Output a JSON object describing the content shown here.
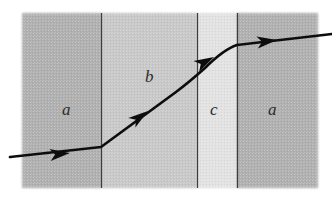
{
  "figure": {
    "background_color": "#ffffff",
    "panel": {
      "x": 22,
      "y": 13,
      "width": 296,
      "height": 175
    },
    "boundary_color": "#3c3c3c",
    "ray_color": "#111111"
  },
  "media": [
    {
      "label": "a",
      "fill": "#b0b0b0",
      "x": 22,
      "width": 79,
      "label_x": 62,
      "label_y": 101
    },
    {
      "label": "b",
      "fill": "#c8c8c8",
      "x": 101,
      "width": 96,
      "label_x": 145,
      "label_y": 68
    },
    {
      "label": "c",
      "fill": "#e2e2e2",
      "x": 197,
      "width": 40,
      "label_x": 210,
      "label_y": 101
    },
    {
      "label": "a",
      "fill": "#b0b0b0",
      "x": 237,
      "width": 81,
      "label_x": 268,
      "label_y": 101
    }
  ],
  "boundaries": [
    {
      "name": "boundary-a-b",
      "x": 101
    },
    {
      "name": "boundary-b-c",
      "x": 197
    },
    {
      "name": "boundary-c-a",
      "x": 237
    }
  ],
  "ray": {
    "path": "M 10,157 L 101,147 L 176,92 C 188,83 196,76 205,68 C 216,57 228,48 237,45 L 332,34",
    "segments": [
      {
        "name": "incident-ray-in-a",
        "medium": "a",
        "from": [
          10,
          157
        ],
        "to": [
          101,
          147
        ]
      },
      {
        "name": "refracted-ray-in-b",
        "medium": "b",
        "from": [
          101,
          147
        ],
        "to": [
          197,
          72
        ]
      },
      {
        "name": "refracted-ray-in-c",
        "medium": "c",
        "from": [
          197,
          72
        ],
        "to": [
          237,
          45
        ]
      },
      {
        "name": "emergent-ray-in-a",
        "medium": "a",
        "from": [
          237,
          45
        ],
        "to": [
          332,
          34
        ]
      }
    ],
    "arrowheads": [
      {
        "name": "arrowhead-1",
        "x": 70,
        "y": 153,
        "angle": -6
      },
      {
        "name": "arrowhead-2",
        "x": 148,
        "y": 111,
        "angle": -36
      },
      {
        "name": "arrowhead-3",
        "x": 214,
        "y": 57,
        "angle": -28
      },
      {
        "name": "arrowhead-4",
        "x": 277,
        "y": 40,
        "angle": -7
      }
    ]
  }
}
